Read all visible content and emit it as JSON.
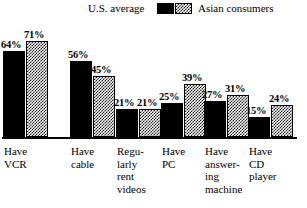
{
  "chart_data": {
    "type": "bar",
    "title": "",
    "subtitle": "",
    "xlabel": "",
    "ylabel": "",
    "ylim": [
      0,
      80
    ],
    "grid": false,
    "legend_position": "top",
    "value_suffix": "%",
    "categories": [
      "Have\nVCR",
      "Have\ncable",
      "Regu-\nlarly\nrent\nvideos",
      "Have\nPC",
      "Have\nanswer-\ning\nmachine",
      "Have\nCD\nplayer"
    ],
    "series": [
      {
        "name": "U.S. average",
        "swatch": "solid-black",
        "color": "#000000",
        "values": [
          64,
          56,
          21,
          25,
          27,
          15
        ],
        "labels": [
          "64%",
          "56%",
          "21%",
          "25%",
          "27%",
          "15%"
        ]
      },
      {
        "name": "Asian consumers",
        "swatch": "checkered",
        "color": "#1a1a1a",
        "values": [
          71,
          45,
          21,
          39,
          31,
          24
        ],
        "labels": [
          "71%",
          "45%",
          "21%",
          "39%",
          "31%",
          "24%"
        ]
      }
    ]
  },
  "legend": {
    "us_label": "U.S. average",
    "asian_label": "Asian consumers"
  }
}
